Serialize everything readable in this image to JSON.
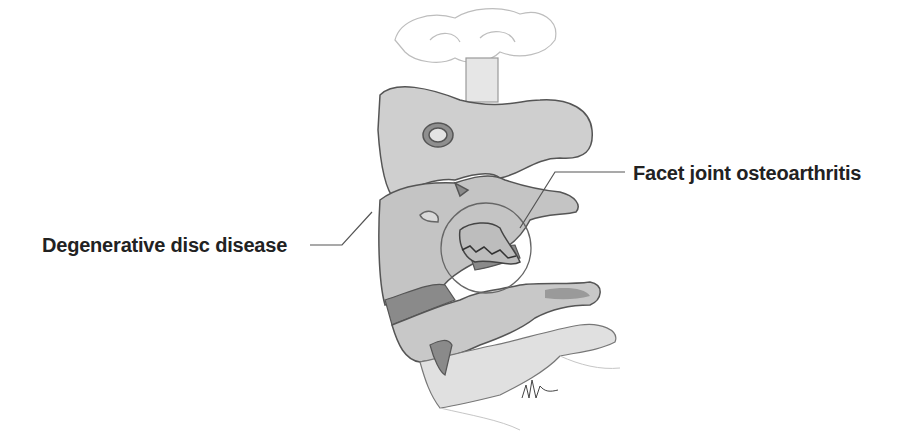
{
  "diagram": {
    "labels": [
      {
        "id": "degenerative-disc-disease",
        "text": "Degenerative disc disease"
      },
      {
        "id": "facet-joint-osteoarthritis",
        "text": "Facet joint osteoarthritis"
      }
    ],
    "signature": "M Hoffman",
    "colors": {
      "bone": "#c8c8c8",
      "bone_light": "#dcdcdc",
      "disc": "#8a8a8a",
      "outline": "#555555",
      "text": "#222222",
      "background": "#ffffff"
    }
  }
}
